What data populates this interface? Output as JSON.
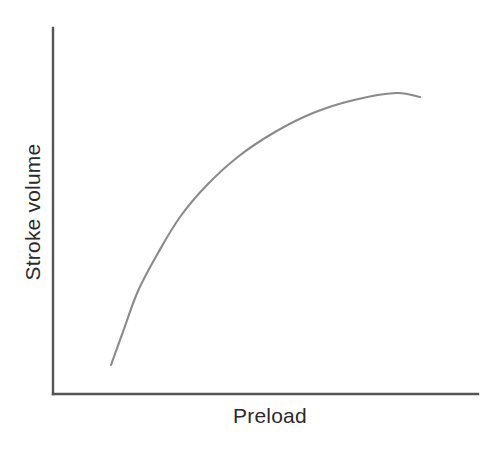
{
  "figure": {
    "background_color": "#ffffff",
    "width": 500,
    "height": 450
  },
  "chart_data": {
    "type": "line",
    "title": "",
    "subtitle": "",
    "xlabel": "Preload",
    "ylabel": "Stroke volume",
    "grid": false,
    "legend": null,
    "legend_position": "none",
    "axis_tick_labels": {
      "x": [],
      "y": []
    },
    "xlim": [
      0,
      1
    ],
    "ylim": [
      0,
      1
    ],
    "annotations": [],
    "series": [
      {
        "name": "Frank-Starling curve",
        "color": "#8a8a8a",
        "line_width": 2.1,
        "x": [
          0.136,
          0.166,
          0.2,
          0.243,
          0.294,
          0.355,
          0.428,
          0.511,
          0.6,
          0.695,
          0.795,
          0.864
        ],
        "y": [
          0.079,
          0.177,
          0.281,
          0.386,
          0.484,
          0.574,
          0.653,
          0.719,
          0.77,
          0.805,
          0.825,
          0.832
        ],
        "pixel_points": [
          [
            111,
            365
          ],
          [
            124,
            329
          ],
          [
            138,
            291
          ],
          [
            158,
            253
          ],
          [
            180,
            217
          ],
          [
            207,
            185
          ],
          [
            239,
            156
          ],
          [
            275,
            132
          ],
          [
            313,
            113
          ],
          [
            354,
            100
          ],
          [
            396,
            93
          ],
          [
            420,
            97
          ]
        ]
      }
    ]
  },
  "axes": {
    "y_axis": {
      "x": 53,
      "y_top": 28,
      "y_bottom": 394,
      "color": "#555555"
    },
    "x_axis": {
      "y": 394,
      "x_left": 53,
      "x_right": 478,
      "color": "#555555"
    }
  },
  "labels": {
    "y_axis_label": "Stroke volume",
    "x_axis_label": "Preload",
    "text_color": "#2b2b2b"
  }
}
